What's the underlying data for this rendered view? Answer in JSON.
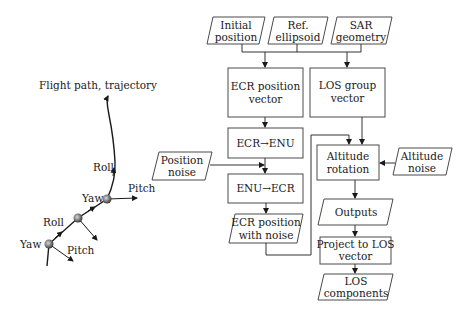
{
  "diagram": {
    "left_panel": {
      "title": "Flight path, trajectory",
      "labels": {
        "roll_top": "Roll",
        "yaw_mid": "Yaw",
        "pitch_mid": "Pitch",
        "roll_bottom": "Roll",
        "yaw_bottom": "Yaw",
        "pitch_bottom": "Pitch"
      }
    },
    "inputs": {
      "initial_position": [
        "Initial",
        "position"
      ],
      "ref_ellipsoid": [
        "Ref.",
        "ellipsoid"
      ],
      "sar_geometry": [
        "SAR",
        "geometry"
      ],
      "position_noise": [
        "Position",
        "noise"
      ],
      "altitude_noise": [
        "Altitude",
        "noise"
      ]
    },
    "processes": {
      "ecr_position_vector": [
        "ECR position",
        "vector"
      ],
      "los_group_vector": [
        "LOS group",
        "vector"
      ],
      "ecr_to_enu": "ECR→ENU",
      "enu_to_ecr": "ENU→ECR",
      "altitude_rotation": [
        "Altitude",
        "rotation"
      ],
      "project_to_los": [
        "Project to LOS",
        "vector"
      ]
    },
    "data_nodes": {
      "ecr_position_with_noise": [
        "ECR position",
        "with noise"
      ],
      "outputs": "Outputs",
      "los_components": [
        "LOS",
        "components"
      ]
    },
    "colors": {
      "stroke": "#4a4a4a",
      "text": "#1a1a1a",
      "background": "#ffffff",
      "node_fill": "#7a7a7a"
    }
  }
}
